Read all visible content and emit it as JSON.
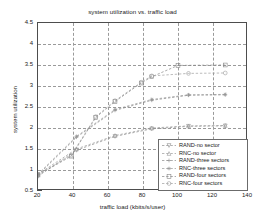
{
  "chart_data": {
    "type": "line",
    "title": "system utilization vs. traffic load",
    "xlabel": "traffic load (kbits/s/user)",
    "ylabel": "system utilization",
    "xlim": [
      20,
      140
    ],
    "ylim": [
      0.5,
      4.5
    ],
    "xticks": [
      20,
      40,
      60,
      80,
      100,
      120,
      140
    ],
    "yticks": [
      0.5,
      1,
      1.5,
      2,
      2.5,
      3,
      3.5,
      4,
      4.5
    ],
    "grid": true,
    "legend_position": "lower-right",
    "series": [
      {
        "name": "RAND-no sector",
        "color": "#8f8f8f",
        "marker": "triangle-down",
        "x": [
          20,
          42,
          64,
          85,
          106,
          127
        ],
        "values": [
          0.85,
          1.47,
          1.8,
          1.98,
          2.04,
          2.05
        ]
      },
      {
        "name": "RNC-no sector",
        "color": "#9a9a9a",
        "marker": "triangle-up",
        "x": [
          20,
          42,
          64,
          85,
          106,
          127
        ],
        "values": [
          0.9,
          1.5,
          1.82,
          2.0,
          2.05,
          2.06
        ]
      },
      {
        "name": "RAND-three sectors",
        "color": "#8a8a8a",
        "marker": "plus",
        "x": [
          20,
          42,
          64,
          85,
          106,
          127
        ],
        "values": [
          0.88,
          1.78,
          2.42,
          2.66,
          2.78,
          2.79
        ]
      },
      {
        "name": "RNC-three sectors",
        "color": "#959595",
        "marker": "asterisk",
        "x": [
          20,
          42,
          64,
          85,
          106,
          127
        ],
        "values": [
          0.9,
          1.8,
          2.44,
          2.68,
          2.79,
          2.8
        ]
      },
      {
        "name": "RAND-four sectors",
        "color": "#878787",
        "marker": "square",
        "x": [
          20,
          39,
          53,
          64,
          79,
          85,
          100,
          127
        ],
        "values": [
          0.88,
          1.33,
          2.25,
          2.63,
          3.07,
          3.22,
          3.49,
          3.5
        ]
      },
      {
        "name": "RNC-four sectors",
        "color": "#9d9d9d",
        "marker": "circle",
        "x": [
          20,
          39,
          53,
          64,
          79,
          85,
          106,
          127
        ],
        "values": [
          0.9,
          1.35,
          2.27,
          2.65,
          3.09,
          3.24,
          3.3,
          3.31
        ]
      }
    ]
  },
  "legend": {
    "items": [
      {
        "label": "RAND-no sector"
      },
      {
        "label": "RNC-no sector"
      },
      {
        "label": "RAND-three sectors"
      },
      {
        "label": "RNC-three sectors"
      },
      {
        "label": "RAND-four sectors"
      },
      {
        "label": "RNC-four sectors"
      }
    ]
  }
}
